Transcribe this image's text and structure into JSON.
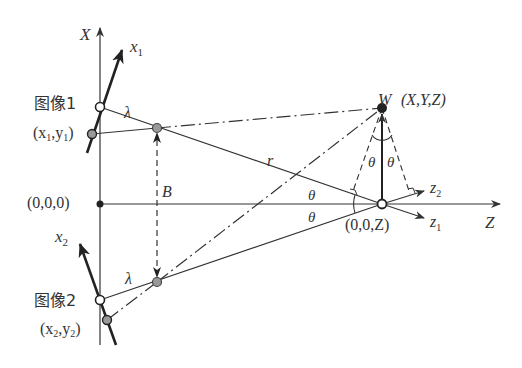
{
  "diagram": {
    "colors": {
      "line": "#333333",
      "lens_point": "#999999",
      "world_point": "#222222",
      "background": "#ffffff"
    },
    "axes": {
      "world_x": "X",
      "world_z": "Z",
      "camera1_axis": "x",
      "camera1_sub": "1",
      "camera2_axis": "x",
      "camera2_sub": "2",
      "z1": "z",
      "z1_sub": "1",
      "z2": "z",
      "z2_sub": "2"
    },
    "labels": {
      "image1": "图像1",
      "image1_coord_open": "(x",
      "image1_coord_sub1": "1",
      "image1_coord_mid": ",y",
      "image1_coord_sub2": "1",
      "image1_coord_close": ")",
      "image2": "图像2",
      "image2_coord_open": "(x",
      "image2_coord_sub1": "2",
      "image2_coord_mid": ",y",
      "image2_coord_sub2": "2",
      "image2_coord_close": ")",
      "origin": "(0,0,0)",
      "center": "(0,0,Z)",
      "world_point_name": "W",
      "world_point_coord": "(X,Y,Z)",
      "lambda_top": "λ",
      "lambda_bottom": "λ",
      "baseline": "B",
      "distance": "r",
      "theta": "θ"
    }
  }
}
